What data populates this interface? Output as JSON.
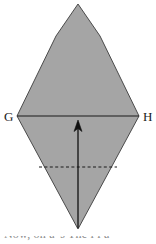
{
  "figure": {
    "background_color": "#ffffff",
    "width": 156,
    "height": 244
  },
  "shape": {
    "name": "rhombus",
    "fill_color": "#a5a5a5",
    "stroke_color": "#4a4a4a",
    "stroke_width": 1,
    "points": "78,4 100,36 139,116 78,229 17,116 56,36"
  },
  "diagonal": {
    "name": "horizontal-diagonal-GH",
    "stroke_color": "#1a1a1a",
    "stroke_width": 1.2,
    "x1": 17,
    "y1": 116,
    "x2": 139,
    "y2": 116
  },
  "dashed_line": {
    "name": "dashed-chord",
    "stroke_color": "#1a1a1a",
    "stroke_width": 1.1,
    "dash_pattern": "3,2.4",
    "x1": 39,
    "y1": 167,
    "x2": 117,
    "y2": 167
  },
  "arrow": {
    "name": "upward-arrow",
    "stroke_color": "#101010",
    "stroke_width": 1.3,
    "tail_x": 78,
    "tail_y": 228,
    "head_x": 78,
    "head_y": 121,
    "head_left": "73.6,131",
    "head_right": "82.4,131"
  },
  "labels": {
    "left_vertex": "G",
    "right_vertex": "H",
    "left_vertex_x": 4,
    "left_vertex_y": 121,
    "right_vertex_x": 143,
    "right_vertex_y": 121
  },
  "caption": {
    "text": "Now, on a   's   The   l   l   a",
    "color": "#8c8c8c",
    "clipped": true
  }
}
